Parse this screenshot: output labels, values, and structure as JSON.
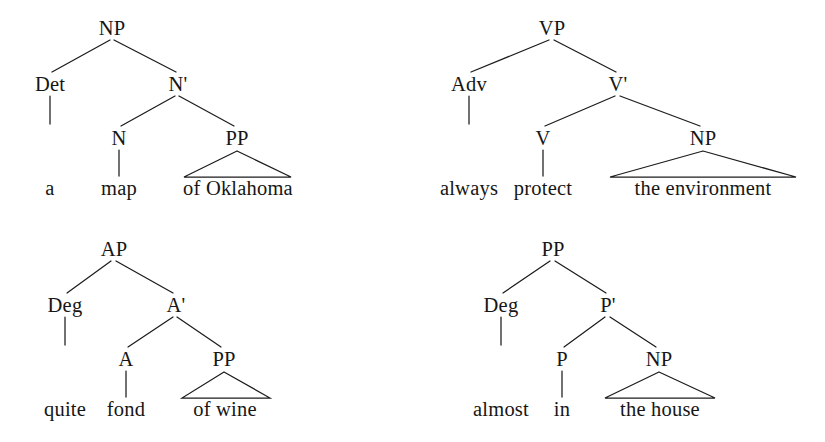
{
  "diagram": {
    "ink_color": "#161616",
    "background_color": "#ffffff",
    "trees": [
      {
        "id": "np-tree",
        "root": "NP",
        "phrase": "a map of Oklahoma",
        "nodes": {
          "root": "NP",
          "specifier": "Det",
          "bar": "N'",
          "head": "N",
          "complement": "PP"
        },
        "words": {
          "specifier_word": "a",
          "head_word": "map",
          "complement_phrase": "of Oklahoma"
        }
      },
      {
        "id": "vp-tree",
        "root": "VP",
        "phrase": "always protect the environment",
        "nodes": {
          "root": "VP",
          "specifier": "Adv",
          "bar": "V'",
          "head": "V",
          "complement": "NP"
        },
        "words": {
          "specifier_word": "always",
          "head_word": "protect",
          "complement_phrase": "the environment"
        }
      },
      {
        "id": "ap-tree",
        "root": "AP",
        "phrase": "quite fond of wine",
        "nodes": {
          "root": "AP",
          "specifier": "Deg",
          "bar": "A'",
          "head": "A",
          "complement": "PP"
        },
        "words": {
          "specifier_word": "quite",
          "head_word": "fond",
          "complement_phrase": "of wine"
        }
      },
      {
        "id": "pp-tree",
        "root": "PP",
        "phrase": "almost in the house",
        "nodes": {
          "root": "PP",
          "specifier": "Deg",
          "bar": "P'",
          "head": "P",
          "complement": "NP"
        },
        "words": {
          "specifier_word": "almost",
          "head_word": "in",
          "complement_phrase": "the house"
        }
      }
    ]
  }
}
